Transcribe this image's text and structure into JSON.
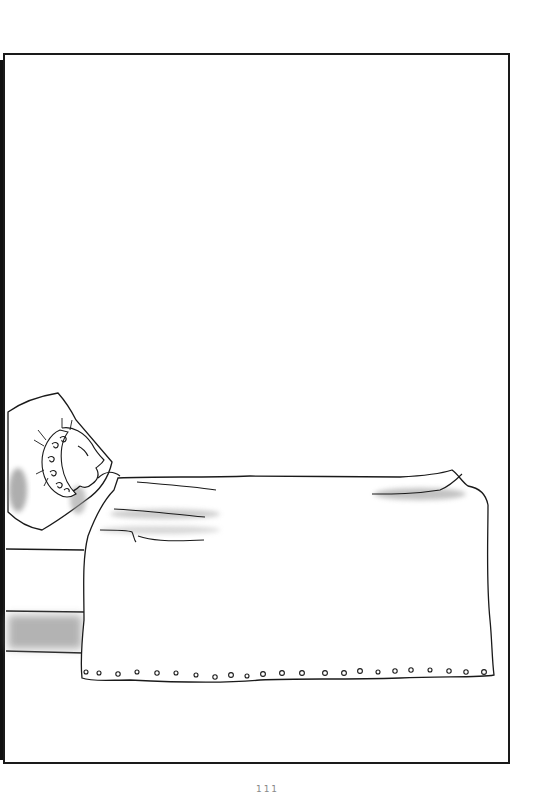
{
  "page": {
    "type": "illustrated-page",
    "page_number": "111",
    "colors": {
      "background": "#ffffff",
      "line": "#1a1a1a",
      "shade": "#9a9a9a",
      "frame": "#1a1a1a"
    }
  },
  "scene": {
    "subjects": [
      "pillow",
      "sleeping-person",
      "bonnet",
      "blanket",
      "bed-frame"
    ],
    "blanket_hem_dots": 24
  }
}
